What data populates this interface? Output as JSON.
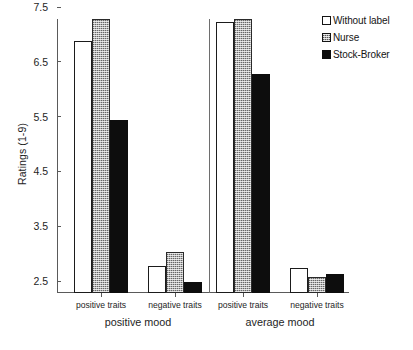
{
  "chart_data": {
    "type": "bar",
    "title": "",
    "xlabel": "",
    "ylabel": "Ratings (1-9)",
    "ylim": [
      2.5,
      7.5
    ],
    "yticks": [
      2.5,
      3.5,
      4.5,
      5.5,
      6.5,
      7.5
    ],
    "ytick_labels": [
      "2.5",
      "3.5",
      "4.5",
      "5.5",
      "6.5",
      "7.5"
    ],
    "grid": false,
    "legend_position": "top-right",
    "categories": [
      "positive traits",
      "negative traits",
      "positive traits",
      "negative traits"
    ],
    "groups": [
      {
        "label": "positive mood",
        "categories": [
          "positive traits",
          "negative traits"
        ]
      },
      {
        "label": "average mood",
        "categories": [
          "positive traits",
          "negative traits"
        ]
      }
    ],
    "series": [
      {
        "name": "Without label",
        "style": "open-white",
        "color": "#ffffff",
        "values": [
          7.1,
          3.0,
          7.45,
          2.95
        ]
      },
      {
        "name": "Nurse",
        "style": "stippled-grey",
        "color": "#b4b4b4",
        "values": [
          7.5,
          3.25,
          7.5,
          2.8
        ]
      },
      {
        "name": "Stock-Broker",
        "style": "solid-black",
        "color": "#0d0d0d",
        "values": [
          5.65,
          2.7,
          6.5,
          2.85
        ]
      }
    ]
  },
  "legend": {
    "items": [
      {
        "label": "Without label"
      },
      {
        "label": "Nurse"
      },
      {
        "label": "Stock-Broker"
      }
    ]
  }
}
